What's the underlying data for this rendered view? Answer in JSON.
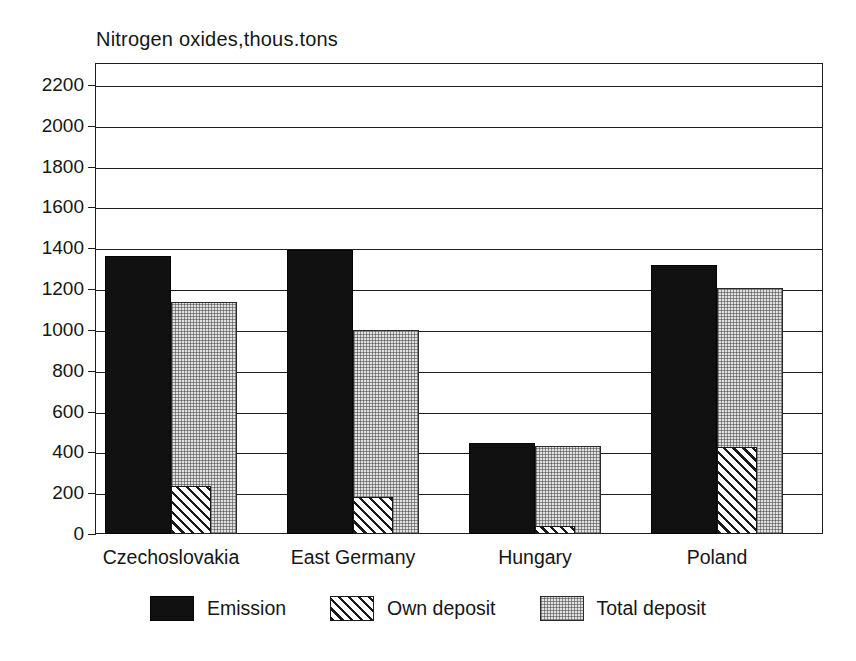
{
  "chart_data": {
    "type": "bar",
    "title": "Nitrogen oxides,thous.tons",
    "xlabel": "",
    "ylabel": "",
    "ylim": [
      0,
      2200
    ],
    "ytick_step": 200,
    "yticks": [
      2200,
      2000,
      1800,
      1600,
      1400,
      1200,
      1000,
      800,
      600,
      400,
      200,
      0
    ],
    "ytick_labels": [
      "2200",
      "2000",
      "1800",
      "1600",
      "1400",
      "1200",
      "1000",
      "800",
      "600",
      "400",
      "200",
      "0"
    ],
    "grid": true,
    "legend_position": "bottom",
    "categories": [
      "Czechoslovakia",
      "East Germany",
      "Hungary",
      "Poland"
    ],
    "series": [
      {
        "name": "Emission",
        "color": "#111111",
        "pattern": "solid",
        "values": [
          1360,
          1390,
          445,
          1320
        ]
      },
      {
        "name": "Own deposit",
        "color": "#ffffff",
        "pattern": "diagonal",
        "values": [
          235,
          180,
          40,
          425
        ]
      },
      {
        "name": "Total deposit",
        "color": "#e2e2e2",
        "pattern": "stipple",
        "values": [
          1135,
          1000,
          430,
          1205
        ]
      }
    ]
  },
  "legend": {
    "items": [
      {
        "label": "Emission"
      },
      {
        "label": "Own deposit"
      },
      {
        "label": "Total deposit"
      }
    ]
  }
}
